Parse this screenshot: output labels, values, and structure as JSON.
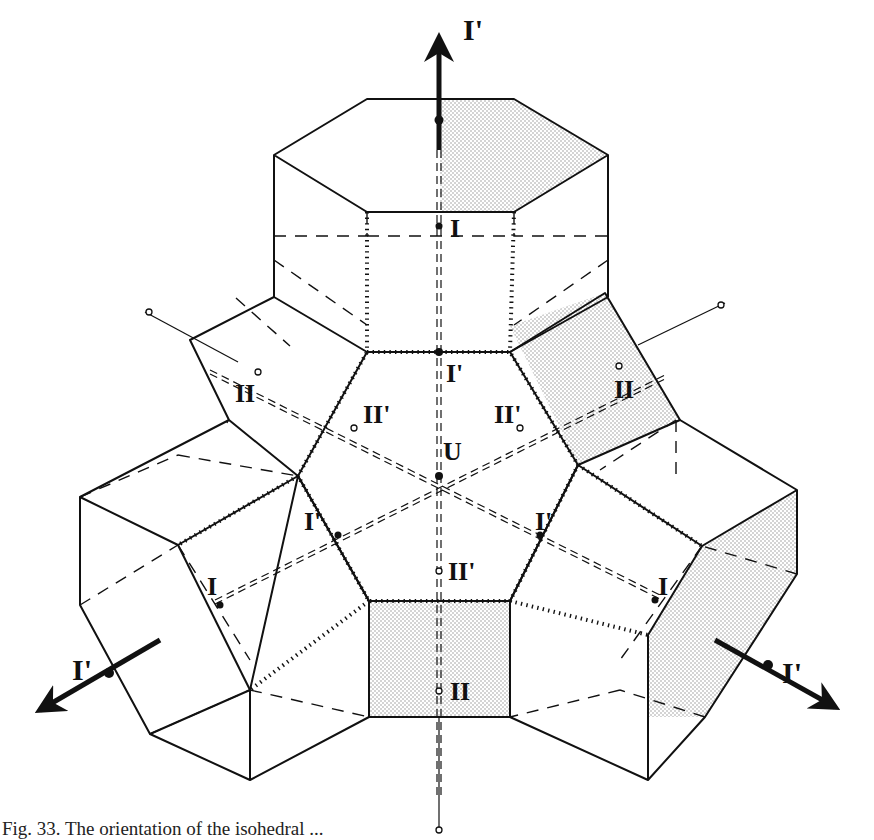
{
  "figure": {
    "caption_visible": "Fig. 33.   The orientation of the isohedral ...",
    "center_label": "U",
    "colors": {
      "ink": "#111111",
      "stipple": "#8a8a8a",
      "paper": "#ffffff"
    },
    "labels": [
      {
        "id": "top-axis-label",
        "text": "I'",
        "x": 463,
        "y": 40,
        "size": 30
      },
      {
        "id": "top-I",
        "text": "I",
        "x": 450,
        "y": 237,
        "size": 26
      },
      {
        "id": "upper-I-prime",
        "text": "I'",
        "x": 446,
        "y": 382,
        "size": 26
      },
      {
        "id": "left-II",
        "text": "II",
        "x": 235,
        "y": 402,
        "size": 26
      },
      {
        "id": "left-II-prime",
        "text": "II'",
        "x": 363,
        "y": 423,
        "size": 26
      },
      {
        "id": "center-U",
        "text": "U",
        "x": 443,
        "y": 460,
        "size": 26
      },
      {
        "id": "right-II-prime",
        "text": "II'",
        "x": 494,
        "y": 423,
        "size": 26
      },
      {
        "id": "right-II",
        "text": "II",
        "x": 614,
        "y": 398,
        "size": 26
      },
      {
        "id": "left-I-prime",
        "text": "I'",
        "x": 304,
        "y": 530,
        "size": 26
      },
      {
        "id": "right-I-prime",
        "text": "I'",
        "x": 535,
        "y": 530,
        "size": 26
      },
      {
        "id": "lower-II-prime",
        "text": "II'",
        "x": 448,
        "y": 580,
        "size": 26
      },
      {
        "id": "left-I",
        "text": "I",
        "x": 207,
        "y": 595,
        "size": 26
      },
      {
        "id": "right-I",
        "text": "I",
        "x": 658,
        "y": 595,
        "size": 26
      },
      {
        "id": "bottom-II",
        "text": "II",
        "x": 450,
        "y": 700,
        "size": 26
      },
      {
        "id": "left-axis-label",
        "text": "I'",
        "x": 72,
        "y": 680,
        "size": 30
      },
      {
        "id": "right-axis-label",
        "text": "I'",
        "x": 782,
        "y": 683,
        "size": 30
      }
    ]
  }
}
